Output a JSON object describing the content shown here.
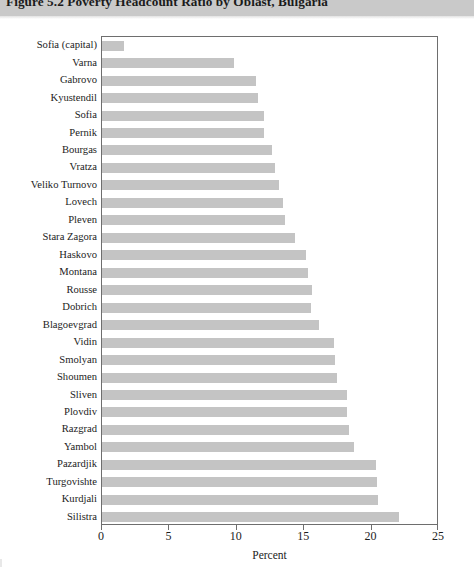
{
  "figure": {
    "title": "Figure 5.2  Poverty Headcount Ratio by Oblast, Bulgaria",
    "title_band_color": "#c9c9c9",
    "bar_color": "#c4c4c4",
    "frame_color": "#6e6e6e"
  },
  "axis": {
    "x_title": "Percent",
    "ticklabels": [
      "0",
      "5",
      "10",
      "15",
      "20",
      "25"
    ],
    "tickvalues": [
      0,
      5,
      10,
      15,
      20,
      25
    ]
  },
  "chart_data": {
    "type": "bar",
    "orientation": "horizontal",
    "title": "Figure 5.2  Poverty Headcount Ratio by Oblast, Bulgaria",
    "xlabel": "Percent",
    "ylabel": "",
    "xlim": [
      0,
      25
    ],
    "grid": false,
    "legend": null,
    "categories": [
      "Sofia (capital)",
      "Varna",
      "Gabrovo",
      "Kyustendil",
      "Sofia",
      "Pernik",
      "Bourgas",
      "Vratza",
      "Veliko Turnovo",
      "Lovech",
      "Pleven",
      "Stara Zagora",
      "Haskovo",
      "Montana",
      "Rousse",
      "Dobrich",
      "Blagoevgrad",
      "Vidin",
      "Smolyan",
      "Shoumen",
      "Sliven",
      "Plovdiv",
      "Razgrad",
      "Yambol",
      "Pazardjik",
      "Turgovishte",
      "Kurdjali",
      "Silistra"
    ],
    "values": [
      1.6,
      9.8,
      11.4,
      11.6,
      12.0,
      12.0,
      12.6,
      12.8,
      13.1,
      13.4,
      13.6,
      14.3,
      15.1,
      15.3,
      15.6,
      15.5,
      16.1,
      17.2,
      17.3,
      17.4,
      18.2,
      18.2,
      18.3,
      18.7,
      20.3,
      20.4,
      20.5,
      22.0
    ]
  }
}
